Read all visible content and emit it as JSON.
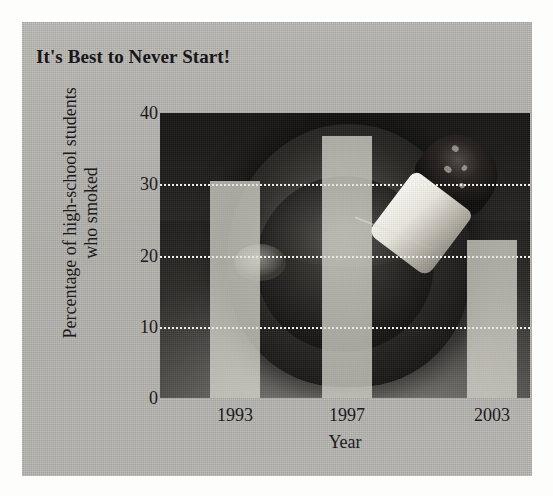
{
  "figure": {
    "panel_color": "#b5b3ae",
    "page_background": "#fdfdfb"
  },
  "chart_data": {
    "type": "bar",
    "title": "It's Best to Never Start!",
    "xlabel": "Year",
    "ylabel_line1": "Percentage of high-school students",
    "ylabel_line2": "who smoked",
    "categories": [
      "1993",
      "1997",
      "2003"
    ],
    "values": [
      30.5,
      36.8,
      22.2
    ],
    "ylim": [
      0,
      40
    ],
    "yticks": [
      0,
      10,
      20,
      30,
      40
    ],
    "ytick_labels": [
      "0",
      "10",
      "20",
      "30",
      "40"
    ],
    "gridlines": [
      10,
      20,
      30
    ],
    "grid": true,
    "legend": false,
    "bar_color": "#e4e2d9",
    "gridline_color": "#f2f0ea",
    "plot_background": "photograph-ashtray-cigarette-butt",
    "text_color": "#1b1a1e"
  },
  "plot_geometry": {
    "bar_width_px": 50,
    "bar_centers_px": [
      75,
      187,
      332
    ],
    "plot_width_px": 370,
    "plot_height_px": 285
  }
}
